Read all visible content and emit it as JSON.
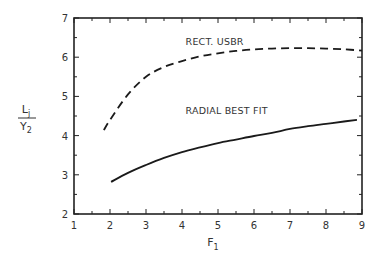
{
  "chart_data": {
    "type": "line",
    "title": "",
    "xlabel": "F",
    "xlabel_sub": "1",
    "ylabel_num": "L",
    "ylabel_num_sub": "j",
    "ylabel_den": "Y",
    "ylabel_den_sub": "2",
    "xlim": [
      1,
      9
    ],
    "ylim": [
      2,
      7
    ],
    "x_ticks": [
      1,
      2,
      3,
      4,
      5,
      6,
      7,
      8,
      9
    ],
    "y_ticks": [
      2,
      3,
      4,
      5,
      6,
      7
    ],
    "grid": false,
    "legend": "inline annotations",
    "series": [
      {
        "name": "RECT. USBR",
        "style": "dashed",
        "x": [
          1.83,
          2.0,
          2.5,
          3.0,
          3.5,
          4.0,
          4.5,
          5.0,
          5.5,
          6.0,
          6.5,
          7.0,
          7.5,
          8.0,
          8.5,
          9.0
        ],
        "y": [
          4.14,
          4.4,
          5.05,
          5.5,
          5.75,
          5.9,
          6.02,
          6.1,
          6.16,
          6.2,
          6.22,
          6.23,
          6.23,
          6.22,
          6.2,
          6.17
        ]
      },
      {
        "name": "RADIAL BEST FIT",
        "style": "solid",
        "x": [
          2.03,
          2.5,
          3.0,
          3.5,
          4.0,
          4.5,
          5.0,
          5.5,
          6.0,
          6.5,
          7.0,
          7.5,
          8.0,
          8.5,
          8.86
        ],
        "y": [
          2.82,
          3.05,
          3.25,
          3.43,
          3.58,
          3.7,
          3.81,
          3.9,
          3.99,
          4.07,
          4.17,
          4.24,
          4.3,
          4.36,
          4.4
        ]
      }
    ],
    "annotations": [
      {
        "text": "RECT. USBR",
        "x": 4.1,
        "y": 6.3
      },
      {
        "text": "RADIAL BEST FIT",
        "x": 4.1,
        "y": 4.55
      }
    ]
  }
}
